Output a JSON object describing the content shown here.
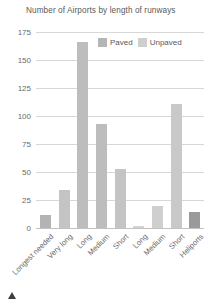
{
  "chart_data": {
    "type": "bar",
    "title": "Number of Airports by length of runways",
    "xlabel": "",
    "ylabel": "",
    "ylim": [
      0,
      175
    ],
    "yticks": [
      0,
      25,
      50,
      75,
      100,
      125,
      150,
      175
    ],
    "grid": true,
    "legend_position": "top-right",
    "categories": [
      "Longest needed",
      "Very long",
      "Long",
      "Medium",
      "Short",
      "Long",
      "Medium",
      "Short",
      "Heliports"
    ],
    "series": [
      {
        "name": "Paved",
        "color": "#b3b3b3",
        "values": [
          12,
          34,
          166,
          93,
          53,
          null,
          null,
          null,
          14
        ]
      },
      {
        "name": "Unpaved",
        "color": "#cfcfcf",
        "values": [
          null,
          null,
          null,
          null,
          null,
          2,
          20,
          111,
          null
        ]
      }
    ],
    "bars": [
      {
        "category": "Longest needed",
        "series": "Paved",
        "value": 12,
        "color": "#b3b3b3"
      },
      {
        "category": "Very long",
        "series": "Paved",
        "value": 34,
        "color": "#c4c4c4"
      },
      {
        "category": "Long",
        "series": "Paved",
        "value": 166,
        "color": "#bdbdbd"
      },
      {
        "category": "Medium",
        "series": "Paved",
        "value": 93,
        "color": "#bdbdbd"
      },
      {
        "category": "Short",
        "series": "Paved",
        "value": 53,
        "color": "#c4c4c4"
      },
      {
        "category": "Long",
        "series": "Unpaved",
        "value": 2,
        "color": "#d4d4d4"
      },
      {
        "category": "Medium",
        "series": "Unpaved",
        "value": 20,
        "color": "#cfcfcf"
      },
      {
        "category": "Short",
        "series": "Unpaved",
        "value": 111,
        "color": "#c9c9c9"
      },
      {
        "category": "Heliports",
        "series": "Paved",
        "value": 14,
        "color": "#9a9a9a"
      }
    ]
  },
  "legend": {
    "items": [
      {
        "label": "Paved",
        "color": "#b5b5b5"
      },
      {
        "label": "Unpaved",
        "color": "#cfcfcf"
      }
    ]
  },
  "colors": {
    "gridline": "#d8d8d8",
    "axis": "#c2c2c2",
    "text": "#59595b",
    "tick_text": "#6b6b6d",
    "marker": "#3f3f41",
    "background": "#ffffff"
  }
}
